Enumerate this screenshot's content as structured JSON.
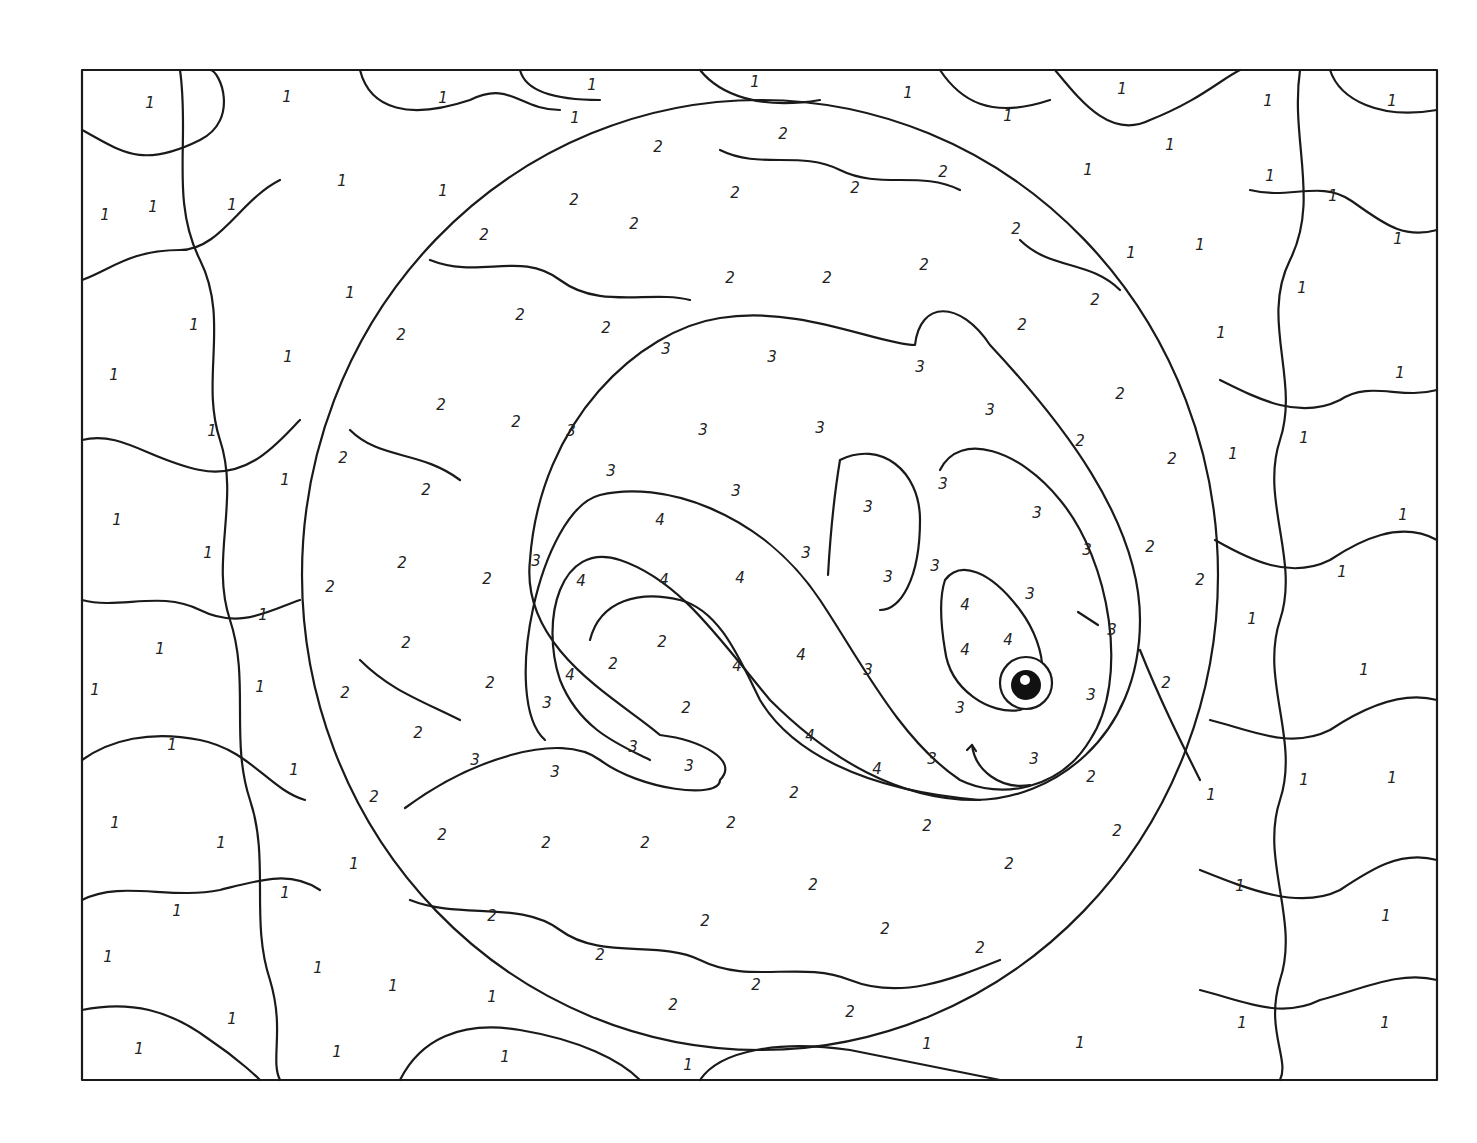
{
  "colors": {
    "line": "#1a1a1a",
    "background": "#ffffff"
  },
  "frame": {
    "x": 82,
    "y": 70,
    "w": 1355,
    "h": 1010
  },
  "circle": {
    "cx": 760,
    "cy": 575,
    "rx": 458,
    "ry": 475
  },
  "labels": [
    {
      "n": "1",
      "x": 150,
      "y": 103
    },
    {
      "n": "1",
      "x": 287,
      "y": 97
    },
    {
      "n": "1",
      "x": 443,
      "y": 98
    },
    {
      "n": "1",
      "x": 592,
      "y": 85
    },
    {
      "n": "1",
      "x": 755,
      "y": 82
    },
    {
      "n": "1",
      "x": 908,
      "y": 93
    },
    {
      "n": "1",
      "x": 1122,
      "y": 89
    },
    {
      "n": "1",
      "x": 1268,
      "y": 101
    },
    {
      "n": "1",
      "x": 1392,
      "y": 101
    },
    {
      "n": "1",
      "x": 575,
      "y": 118
    },
    {
      "n": "1",
      "x": 1008,
      "y": 116
    },
    {
      "n": "1",
      "x": 1170,
      "y": 145
    },
    {
      "n": "1",
      "x": 1088,
      "y": 170
    },
    {
      "n": "1",
      "x": 1270,
      "y": 176
    },
    {
      "n": "1",
      "x": 1333,
      "y": 196
    },
    {
      "n": "1",
      "x": 105,
      "y": 215
    },
    {
      "n": "1",
      "x": 153,
      "y": 207
    },
    {
      "n": "1",
      "x": 232,
      "y": 205
    },
    {
      "n": "1",
      "x": 342,
      "y": 181
    },
    {
      "n": "1",
      "x": 443,
      "y": 191
    },
    {
      "n": "1",
      "x": 1131,
      "y": 253
    },
    {
      "n": "1",
      "x": 1200,
      "y": 245
    },
    {
      "n": "1",
      "x": 1398,
      "y": 239
    },
    {
      "n": "1",
      "x": 350,
      "y": 293
    },
    {
      "n": "1",
      "x": 194,
      "y": 325
    },
    {
      "n": "1",
      "x": 1302,
      "y": 288
    },
    {
      "n": "1",
      "x": 288,
      "y": 357
    },
    {
      "n": "1",
      "x": 1221,
      "y": 333
    },
    {
      "n": "1",
      "x": 114,
      "y": 375
    },
    {
      "n": "1",
      "x": 1400,
      "y": 373
    },
    {
      "n": "1",
      "x": 212,
      "y": 431
    },
    {
      "n": "1",
      "x": 1304,
      "y": 438
    },
    {
      "n": "1",
      "x": 1233,
      "y": 454
    },
    {
      "n": "1",
      "x": 285,
      "y": 480
    },
    {
      "n": "1",
      "x": 117,
      "y": 520
    },
    {
      "n": "1",
      "x": 1403,
      "y": 515
    },
    {
      "n": "1",
      "x": 208,
      "y": 553
    },
    {
      "n": "1",
      "x": 1342,
      "y": 572
    },
    {
      "n": "1",
      "x": 263,
      "y": 615
    },
    {
      "n": "1",
      "x": 1252,
      "y": 619
    },
    {
      "n": "1",
      "x": 160,
      "y": 649
    },
    {
      "n": "1",
      "x": 1364,
      "y": 670
    },
    {
      "n": "1",
      "x": 95,
      "y": 690
    },
    {
      "n": "1",
      "x": 260,
      "y": 687
    },
    {
      "n": "1",
      "x": 172,
      "y": 745
    },
    {
      "n": "1",
      "x": 294,
      "y": 770
    },
    {
      "n": "1",
      "x": 1304,
      "y": 780
    },
    {
      "n": "1",
      "x": 1392,
      "y": 778
    },
    {
      "n": "1",
      "x": 1211,
      "y": 795
    },
    {
      "n": "1",
      "x": 115,
      "y": 823
    },
    {
      "n": "1",
      "x": 221,
      "y": 843
    },
    {
      "n": "1",
      "x": 354,
      "y": 864
    },
    {
      "n": "1",
      "x": 1240,
      "y": 886
    },
    {
      "n": "1",
      "x": 285,
      "y": 893
    },
    {
      "n": "1",
      "x": 177,
      "y": 911
    },
    {
      "n": "1",
      "x": 1386,
      "y": 916
    },
    {
      "n": "1",
      "x": 108,
      "y": 957
    },
    {
      "n": "1",
      "x": 318,
      "y": 968
    },
    {
      "n": "1",
      "x": 393,
      "y": 986
    },
    {
      "n": "1",
      "x": 492,
      "y": 997
    },
    {
      "n": "1",
      "x": 232,
      "y": 1019
    },
    {
      "n": "1",
      "x": 1242,
      "y": 1023
    },
    {
      "n": "1",
      "x": 1385,
      "y": 1023
    },
    {
      "n": "1",
      "x": 139,
      "y": 1049
    },
    {
      "n": "1",
      "x": 337,
      "y": 1052
    },
    {
      "n": "1",
      "x": 505,
      "y": 1057
    },
    {
      "n": "1",
      "x": 688,
      "y": 1065
    },
    {
      "n": "1",
      "x": 927,
      "y": 1044
    },
    {
      "n": "1",
      "x": 1080,
      "y": 1043
    },
    {
      "n": "2",
      "x": 658,
      "y": 147
    },
    {
      "n": "2",
      "x": 783,
      "y": 134
    },
    {
      "n": "2",
      "x": 943,
      "y": 172
    },
    {
      "n": "2",
      "x": 574,
      "y": 200
    },
    {
      "n": "2",
      "x": 735,
      "y": 193
    },
    {
      "n": "2",
      "x": 855,
      "y": 188
    },
    {
      "n": "2",
      "x": 484,
      "y": 235
    },
    {
      "n": "2",
      "x": 1016,
      "y": 229
    },
    {
      "n": "2",
      "x": 634,
      "y": 224
    },
    {
      "n": "2",
      "x": 730,
      "y": 278
    },
    {
      "n": "2",
      "x": 827,
      "y": 278
    },
    {
      "n": "2",
      "x": 924,
      "y": 265
    },
    {
      "n": "2",
      "x": 1095,
      "y": 300
    },
    {
      "n": "2",
      "x": 520,
      "y": 315
    },
    {
      "n": "2",
      "x": 606,
      "y": 328
    },
    {
      "n": "2",
      "x": 1022,
      "y": 325
    },
    {
      "n": "2",
      "x": 401,
      "y": 335
    },
    {
      "n": "2",
      "x": 441,
      "y": 405
    },
    {
      "n": "2",
      "x": 516,
      "y": 422
    },
    {
      "n": "2",
      "x": 1120,
      "y": 394
    },
    {
      "n": "2",
      "x": 1080,
      "y": 441
    },
    {
      "n": "2",
      "x": 343,
      "y": 458
    },
    {
      "n": "2",
      "x": 1172,
      "y": 459
    },
    {
      "n": "2",
      "x": 426,
      "y": 490
    },
    {
      "n": "2",
      "x": 1150,
      "y": 547
    },
    {
      "n": "2",
      "x": 402,
      "y": 563
    },
    {
      "n": "2",
      "x": 487,
      "y": 579
    },
    {
      "n": "2",
      "x": 330,
      "y": 587
    },
    {
      "n": "2",
      "x": 1200,
      "y": 580
    },
    {
      "n": "2",
      "x": 406,
      "y": 643
    },
    {
      "n": "2",
      "x": 662,
      "y": 642
    },
    {
      "n": "2",
      "x": 613,
      "y": 664
    },
    {
      "n": "2",
      "x": 345,
      "y": 693
    },
    {
      "n": "2",
      "x": 490,
      "y": 683
    },
    {
      "n": "2",
      "x": 1166,
      "y": 683
    },
    {
      "n": "2",
      "x": 686,
      "y": 708
    },
    {
      "n": "2",
      "x": 418,
      "y": 733
    },
    {
      "n": "2",
      "x": 1091,
      "y": 777
    },
    {
      "n": "2",
      "x": 374,
      "y": 797
    },
    {
      "n": "2",
      "x": 794,
      "y": 793
    },
    {
      "n": "2",
      "x": 731,
      "y": 823
    },
    {
      "n": "2",
      "x": 927,
      "y": 826
    },
    {
      "n": "2",
      "x": 1117,
      "y": 831
    },
    {
      "n": "2",
      "x": 442,
      "y": 835
    },
    {
      "n": "2",
      "x": 546,
      "y": 843
    },
    {
      "n": "2",
      "x": 645,
      "y": 843
    },
    {
      "n": "2",
      "x": 1009,
      "y": 864
    },
    {
      "n": "2",
      "x": 813,
      "y": 885
    },
    {
      "n": "2",
      "x": 492,
      "y": 916
    },
    {
      "n": "2",
      "x": 705,
      "y": 921
    },
    {
      "n": "2",
      "x": 885,
      "y": 929
    },
    {
      "n": "2",
      "x": 600,
      "y": 955
    },
    {
      "n": "2",
      "x": 980,
      "y": 948
    },
    {
      "n": "2",
      "x": 756,
      "y": 985
    },
    {
      "n": "2",
      "x": 673,
      "y": 1005
    },
    {
      "n": "2",
      "x": 850,
      "y": 1012
    },
    {
      "n": "3",
      "x": 666,
      "y": 349
    },
    {
      "n": "3",
      "x": 772,
      "y": 357
    },
    {
      "n": "3",
      "x": 920,
      "y": 367
    },
    {
      "n": "3",
      "x": 990,
      "y": 410
    },
    {
      "n": "3",
      "x": 571,
      "y": 431
    },
    {
      "n": "3",
      "x": 703,
      "y": 430
    },
    {
      "n": "3",
      "x": 820,
      "y": 428
    },
    {
      "n": "3",
      "x": 611,
      "y": 471
    },
    {
      "n": "3",
      "x": 736,
      "y": 491
    },
    {
      "n": "3",
      "x": 943,
      "y": 484
    },
    {
      "n": "3",
      "x": 868,
      "y": 507
    },
    {
      "n": "3",
      "x": 1037,
      "y": 513
    },
    {
      "n": "3",
      "x": 536,
      "y": 561
    },
    {
      "n": "3",
      "x": 806,
      "y": 553
    },
    {
      "n": "3",
      "x": 888,
      "y": 577
    },
    {
      "n": "3",
      "x": 935,
      "y": 566
    },
    {
      "n": "3",
      "x": 1087,
      "y": 550
    },
    {
      "n": "3",
      "x": 1030,
      "y": 594
    },
    {
      "n": "3",
      "x": 1112,
      "y": 630
    },
    {
      "n": "3",
      "x": 868,
      "y": 670
    },
    {
      "n": "3",
      "x": 1091,
      "y": 695
    },
    {
      "n": "3",
      "x": 547,
      "y": 703
    },
    {
      "n": "3",
      "x": 960,
      "y": 708
    },
    {
      "n": "3",
      "x": 633,
      "y": 747
    },
    {
      "n": "3",
      "x": 475,
      "y": 760
    },
    {
      "n": "3",
      "x": 555,
      "y": 772
    },
    {
      "n": "3",
      "x": 689,
      "y": 766
    },
    {
      "n": "3",
      "x": 932,
      "y": 759
    },
    {
      "n": "3",
      "x": 1034,
      "y": 759
    },
    {
      "n": "4",
      "x": 660,
      "y": 520
    },
    {
      "n": "4",
      "x": 581,
      "y": 581
    },
    {
      "n": "4",
      "x": 664,
      "y": 580
    },
    {
      "n": "4",
      "x": 740,
      "y": 578
    },
    {
      "n": "4",
      "x": 965,
      "y": 605
    },
    {
      "n": "4",
      "x": 1008,
      "y": 640
    },
    {
      "n": "4",
      "x": 965,
      "y": 650
    },
    {
      "n": "4",
      "x": 801,
      "y": 655
    },
    {
      "n": "4",
      "x": 737,
      "y": 666
    },
    {
      "n": "4",
      "x": 570,
      "y": 675
    },
    {
      "n": "4",
      "x": 810,
      "y": 736
    },
    {
      "n": "4",
      "x": 877,
      "y": 769
    }
  ]
}
